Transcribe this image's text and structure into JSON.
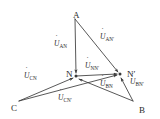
{
  "diagram": {
    "type": "phasor-vector-diagram",
    "stroke_color": "#3a3a3a",
    "text_color": "#2b2b2b",
    "background_color": "#ffffff",
    "vertices": [
      {
        "id": "A",
        "label": "A",
        "x": 73,
        "y": 11
      },
      {
        "id": "B",
        "label": "B",
        "x": 139,
        "y": 106
      },
      {
        "id": "C",
        "label": "C",
        "x": 11,
        "y": 104
      },
      {
        "id": "N",
        "label": "N",
        "x": 66,
        "y": 70
      },
      {
        "id": "Np",
        "label": "N′",
        "x": 127,
        "y": 70
      }
    ],
    "nodes": {
      "A": {
        "x": 75,
        "y": 19
      },
      "B": {
        "x": 133,
        "y": 101
      },
      "C": {
        "x": 19,
        "y": 101
      },
      "N": {
        "x": 76,
        "y": 76
      },
      "Np": {
        "x": 120,
        "y": 74
      }
    },
    "phasors": [
      {
        "id": "U_AN",
        "u": "U",
        "sub": "AN",
        "from": "A",
        "to": "N",
        "label_x": 54,
        "label_y": 40
      },
      {
        "id": "U_ANp",
        "u": "U",
        "sub": "AN′",
        "from": "A",
        "to": "Np",
        "label_x": 100,
        "label_y": 33
      },
      {
        "id": "U_NNp",
        "u": "U",
        "sub": "NN′",
        "from": "N",
        "to": "Np",
        "label_x": 85,
        "label_y": 62
      },
      {
        "id": "U_CN",
        "u": "U",
        "sub": "CN",
        "from": "C",
        "to": "N",
        "label_x": 24,
        "label_y": 72
      },
      {
        "id": "U_CNp",
        "u": "U",
        "sub": "CN′",
        "from": "C",
        "to": "Np",
        "label_x": 58,
        "label_y": 94
      },
      {
        "id": "U_BN",
        "u": "U",
        "sub": "BN",
        "from": "B",
        "to": "N",
        "label_x": 100,
        "label_y": 80
      },
      {
        "id": "U_BNp",
        "u": "U",
        "sub": "BN′",
        "from": "B",
        "to": "Np",
        "label_x": 130,
        "label_y": 78
      }
    ]
  }
}
